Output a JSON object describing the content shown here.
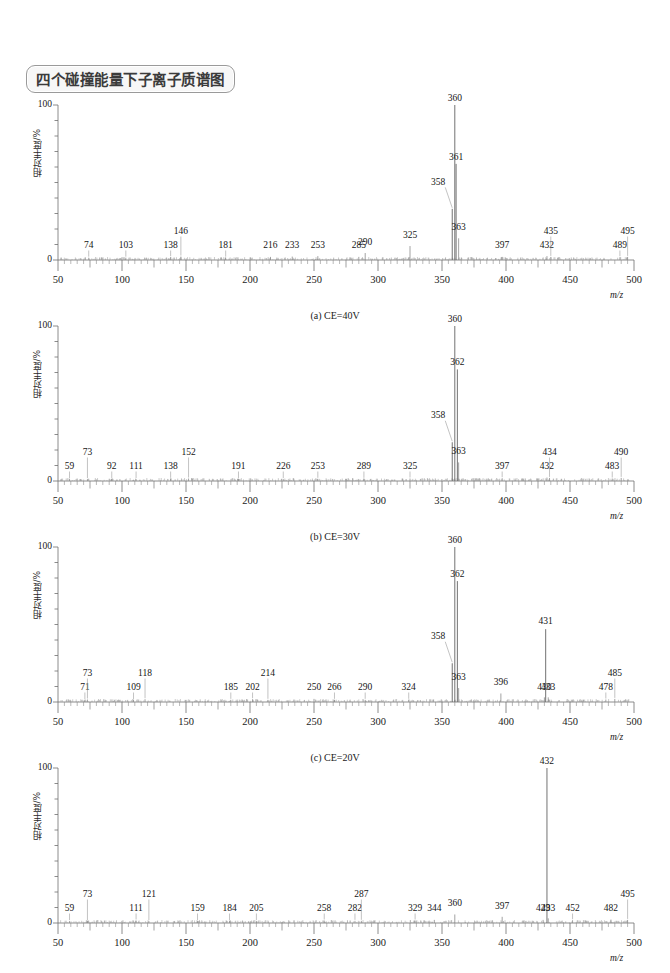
{
  "title": "四个碰撞能量下子离子质谱图",
  "axes": {
    "ylabel": "相对丰度/%",
    "xlabel": "m/z",
    "yticks": [
      "100",
      "0"
    ],
    "xticks": [
      "50",
      "100",
      "150",
      "200",
      "250",
      "300",
      "350",
      "400",
      "450",
      "500"
    ],
    "xlim": [
      50,
      500
    ],
    "ylim": [
      0,
      100
    ]
  },
  "captions": {
    "a": "(a) CE=40V",
    "b": "(b) CE=30V",
    "c": "(c) CE=20V",
    "d": "(d) CE=10V"
  },
  "chart_data": [
    {
      "type": "bar",
      "id": "a",
      "title": "(a) CE=40V",
      "xlabel": "m/z",
      "ylabel": "相对丰度/%",
      "xlim": [
        50,
        500
      ],
      "ylim": [
        0,
        100
      ],
      "grid": false,
      "legend": "none",
      "labeled_peaks": [
        {
          "mz": 74,
          "value": 1.5
        },
        {
          "mz": 103,
          "value": 1.5
        },
        {
          "mz": 138,
          "value": 1.8
        },
        {
          "mz": 146,
          "value": 2.2
        },
        {
          "mz": 181,
          "value": 1.5
        },
        {
          "mz": 216,
          "value": 2.0
        },
        {
          "mz": 233,
          "value": 2.2
        },
        {
          "mz": 253,
          "value": 2.5
        },
        {
          "mz": 285,
          "value": 2.0
        },
        {
          "mz": 290,
          "value": 4.5
        },
        {
          "mz": 325,
          "value": 9.0
        },
        {
          "mz": 358,
          "value": 33.0
        },
        {
          "mz": 360,
          "value": 100.0
        },
        {
          "mz": 361,
          "value": 62.0
        },
        {
          "mz": 363,
          "value": 14.0
        },
        {
          "mz": 397,
          "value": 2.0
        },
        {
          "mz": 432,
          "value": 2.5
        },
        {
          "mz": 435,
          "value": 2.0
        },
        {
          "mz": 489,
          "value": 1.8
        },
        {
          "mz": 495,
          "value": 2.0
        }
      ]
    },
    {
      "type": "bar",
      "id": "b",
      "title": "(b) CE=30V",
      "xlabel": "m/z",
      "ylabel": "相对丰度/%",
      "xlim": [
        50,
        500
      ],
      "ylim": [
        0,
        100
      ],
      "grid": false,
      "legend": "none",
      "labeled_peaks": [
        {
          "mz": 59,
          "value": 1.2
        },
        {
          "mz": 73,
          "value": 1.2
        },
        {
          "mz": 92,
          "value": 1.2
        },
        {
          "mz": 111,
          "value": 1.2
        },
        {
          "mz": 138,
          "value": 1.4
        },
        {
          "mz": 152,
          "value": 1.6
        },
        {
          "mz": 191,
          "value": 1.2
        },
        {
          "mz": 226,
          "value": 1.2
        },
        {
          "mz": 253,
          "value": 1.4
        },
        {
          "mz": 289,
          "value": 1.4
        },
        {
          "mz": 325,
          "value": 1.6
        },
        {
          "mz": 358,
          "value": 25.0
        },
        {
          "mz": 360,
          "value": 100.0
        },
        {
          "mz": 362,
          "value": 72.0
        },
        {
          "mz": 363,
          "value": 12.0
        },
        {
          "mz": 397,
          "value": 1.8
        },
        {
          "mz": 432,
          "value": 2.2
        },
        {
          "mz": 434,
          "value": 2.0
        },
        {
          "mz": 483,
          "value": 1.6
        },
        {
          "mz": 490,
          "value": 2.0
        }
      ]
    },
    {
      "type": "bar",
      "id": "c",
      "title": "(c) CE=20V",
      "xlabel": "m/z",
      "ylabel": "相对丰度/%",
      "xlim": [
        50,
        500
      ],
      "ylim": [
        0,
        100
      ],
      "grid": false,
      "legend": "none",
      "labeled_peaks": [
        {
          "mz": 71,
          "value": 1.2
        },
        {
          "mz": 73,
          "value": 1.6
        },
        {
          "mz": 109,
          "value": 1.2
        },
        {
          "mz": 118,
          "value": 1.8
        },
        {
          "mz": 185,
          "value": 1.4
        },
        {
          "mz": 202,
          "value": 1.8
        },
        {
          "mz": 214,
          "value": 1.4
        },
        {
          "mz": 250,
          "value": 2.0
        },
        {
          "mz": 266,
          "value": 1.4
        },
        {
          "mz": 290,
          "value": 1.4
        },
        {
          "mz": 324,
          "value": 1.4
        },
        {
          "mz": 358,
          "value": 25.0
        },
        {
          "mz": 360,
          "value": 100.0
        },
        {
          "mz": 362,
          "value": 78.0
        },
        {
          "mz": 363,
          "value": 9.0
        },
        {
          "mz": 396,
          "value": 5.5
        },
        {
          "mz": 430,
          "value": 3.0
        },
        {
          "mz": 431,
          "value": 47.0
        },
        {
          "mz": 433,
          "value": 3.0
        },
        {
          "mz": 478,
          "value": 1.6
        },
        {
          "mz": 485,
          "value": 2.0
        }
      ]
    },
    {
      "type": "bar",
      "id": "d",
      "title": "(d) CE=10V",
      "xlabel": "m/z",
      "ylabel": "相对丰度/%",
      "xlim": [
        50,
        500
      ],
      "ylim": [
        0,
        100
      ],
      "grid": false,
      "legend": "none",
      "labeled_peaks": [
        {
          "mz": 59,
          "value": 1.2
        },
        {
          "mz": 73,
          "value": 1.2
        },
        {
          "mz": 111,
          "value": 1.6
        },
        {
          "mz": 121,
          "value": 1.2
        },
        {
          "mz": 159,
          "value": 1.2
        },
        {
          "mz": 184,
          "value": 1.2
        },
        {
          "mz": 205,
          "value": 1.2
        },
        {
          "mz": 258,
          "value": 1.6
        },
        {
          "mz": 282,
          "value": 1.4
        },
        {
          "mz": 287,
          "value": 1.4
        },
        {
          "mz": 329,
          "value": 1.6
        },
        {
          "mz": 344,
          "value": 2.0
        },
        {
          "mz": 360,
          "value": 5.5
        },
        {
          "mz": 397,
          "value": 4.0
        },
        {
          "mz": 429,
          "value": 2.0
        },
        {
          "mz": 432,
          "value": 100.0
        },
        {
          "mz": 433,
          "value": 3.0
        },
        {
          "mz": 452,
          "value": 1.8
        },
        {
          "mz": 482,
          "value": 2.2
        },
        {
          "mz": 495,
          "value": 2.0
        }
      ]
    }
  ]
}
